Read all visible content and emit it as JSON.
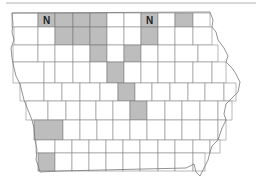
{
  "map": {
    "region": "Iowa counties",
    "shaded_color": "#bdbdbd",
    "unshaded_color": "#ffffff",
    "border_color": "#8a8a8a",
    "labels": [
      {
        "text": "N",
        "county": "r1c2"
      },
      {
        "text": "N",
        "county": "r1c8"
      }
    ],
    "shaded_counties": [
      "r1c2",
      "r1c3",
      "r1c4",
      "r1c5",
      "r1c8",
      "r1c10",
      "r2c3",
      "r2c4",
      "r2c5",
      "r2c8",
      "r3c5",
      "r3c7",
      "r4c6",
      "r5c6",
      "r6c7",
      "r7c1",
      "r9c1"
    ]
  }
}
